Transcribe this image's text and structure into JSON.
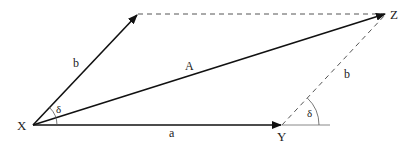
{
  "diagram": {
    "type": "vector-parallelogram",
    "colors": {
      "line": "#111111",
      "dashed": "#555555",
      "ref": "#888888",
      "text": "#222222"
    },
    "points": {
      "X": {
        "label": "X",
        "x": 33,
        "y": 125
      },
      "Y": {
        "label": "Y",
        "x": 282,
        "y": 125
      },
      "Z": {
        "label": "Z",
        "x": 386,
        "y": 14
      },
      "B": {
        "x": 138,
        "y": 14
      }
    },
    "vectors": {
      "a": {
        "label": "a",
        "from": "X",
        "to": "Y"
      },
      "b": {
        "label": "b",
        "from": "X",
        "to": "B"
      },
      "A": {
        "label": "A",
        "from": "X",
        "to": "Z"
      }
    },
    "dashed": {
      "b_translated": {
        "label": "b",
        "from": "Y",
        "to": "Z"
      },
      "top_edge": {
        "from": "B",
        "to": "Z"
      }
    },
    "angles": {
      "at_X": {
        "label": "δ"
      },
      "at_Y": {
        "label": "δ"
      }
    }
  }
}
